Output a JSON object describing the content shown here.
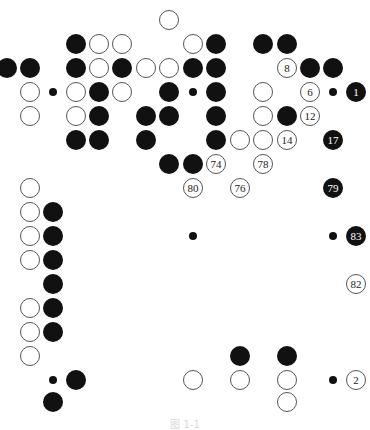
{
  "figure": {
    "type": "go-board-diagram",
    "caption": "图 1-1",
    "grid": {
      "columns_x": [
        7,
        30,
        53,
        76,
        99,
        122,
        146,
        169,
        193,
        216,
        240,
        263,
        287,
        310,
        333,
        356
      ],
      "rows_y": [
        20,
        44,
        68,
        92,
        116,
        140,
        164,
        188,
        212,
        236,
        260,
        284,
        308,
        332,
        356,
        380,
        402
      ]
    },
    "colors": {
      "black": "#111111",
      "white": "#ffffff",
      "outline": "#555555"
    },
    "stones": [
      {
        "c": 7,
        "r": 0,
        "color": "white",
        "label": ""
      },
      {
        "c": 3,
        "r": 1,
        "color": "black",
        "label": ""
      },
      {
        "c": 4,
        "r": 1,
        "color": "white",
        "label": ""
      },
      {
        "c": 5,
        "r": 1,
        "color": "white",
        "label": ""
      },
      {
        "c": 8,
        "r": 1,
        "color": "white",
        "label": ""
      },
      {
        "c": 9,
        "r": 1,
        "color": "black",
        "label": ""
      },
      {
        "c": 11,
        "r": 1,
        "color": "black",
        "label": ""
      },
      {
        "c": 12,
        "r": 1,
        "color": "black",
        "label": ""
      },
      {
        "c": 0,
        "r": 2,
        "color": "black",
        "label": ""
      },
      {
        "c": 1,
        "r": 2,
        "color": "black",
        "label": ""
      },
      {
        "c": 3,
        "r": 2,
        "color": "black",
        "label": ""
      },
      {
        "c": 4,
        "r": 2,
        "color": "white",
        "label": ""
      },
      {
        "c": 5,
        "r": 2,
        "color": "black",
        "label": ""
      },
      {
        "c": 6,
        "r": 2,
        "color": "white",
        "label": ""
      },
      {
        "c": 7,
        "r": 2,
        "color": "white",
        "label": ""
      },
      {
        "c": 8,
        "r": 2,
        "color": "black",
        "label": ""
      },
      {
        "c": 9,
        "r": 2,
        "color": "black",
        "label": ""
      },
      {
        "c": 12,
        "r": 2,
        "color": "white",
        "label": "8"
      },
      {
        "c": 13,
        "r": 2,
        "color": "black",
        "label": ""
      },
      {
        "c": 14,
        "r": 2,
        "color": "black",
        "label": ""
      },
      {
        "c": 1,
        "r": 3,
        "color": "white",
        "label": ""
      },
      {
        "c": 3,
        "r": 3,
        "color": "white",
        "label": ""
      },
      {
        "c": 4,
        "r": 3,
        "color": "black",
        "label": ""
      },
      {
        "c": 5,
        "r": 3,
        "color": "white",
        "label": ""
      },
      {
        "c": 7,
        "r": 3,
        "color": "black",
        "label": ""
      },
      {
        "c": 9,
        "r": 3,
        "color": "black",
        "label": ""
      },
      {
        "c": 11,
        "r": 3,
        "color": "white",
        "label": ""
      },
      {
        "c": 13,
        "r": 3,
        "color": "white",
        "label": "6"
      },
      {
        "c": 15,
        "r": 3,
        "color": "black",
        "label": "1"
      },
      {
        "c": 1,
        "r": 4,
        "color": "white",
        "label": ""
      },
      {
        "c": 3,
        "r": 4,
        "color": "white",
        "label": ""
      },
      {
        "c": 4,
        "r": 4,
        "color": "black",
        "label": ""
      },
      {
        "c": 6,
        "r": 4,
        "color": "black",
        "label": ""
      },
      {
        "c": 7,
        "r": 4,
        "color": "black",
        "label": ""
      },
      {
        "c": 9,
        "r": 4,
        "color": "black",
        "label": ""
      },
      {
        "c": 11,
        "r": 4,
        "color": "white",
        "label": ""
      },
      {
        "c": 12,
        "r": 4,
        "color": "black",
        "label": ""
      },
      {
        "c": 13,
        "r": 4,
        "color": "white",
        "label": "12"
      },
      {
        "c": 3,
        "r": 5,
        "color": "black",
        "label": ""
      },
      {
        "c": 4,
        "r": 5,
        "color": "black",
        "label": ""
      },
      {
        "c": 6,
        "r": 5,
        "color": "black",
        "label": ""
      },
      {
        "c": 9,
        "r": 5,
        "color": "black",
        "label": ""
      },
      {
        "c": 10,
        "r": 5,
        "color": "white",
        "label": ""
      },
      {
        "c": 11,
        "r": 5,
        "color": "white",
        "label": ""
      },
      {
        "c": 12,
        "r": 5,
        "color": "white",
        "label": "14"
      },
      {
        "c": 14,
        "r": 5,
        "color": "black",
        "label": "17"
      },
      {
        "c": 7,
        "r": 6,
        "color": "black",
        "label": ""
      },
      {
        "c": 8,
        "r": 6,
        "color": "black",
        "label": ""
      },
      {
        "c": 9,
        "r": 6,
        "color": "white",
        "label": "74"
      },
      {
        "c": 11,
        "r": 6,
        "color": "white",
        "label": "78"
      },
      {
        "c": 1,
        "r": 7,
        "color": "white",
        "label": ""
      },
      {
        "c": 8,
        "r": 7,
        "color": "white",
        "label": "80"
      },
      {
        "c": 10,
        "r": 7,
        "color": "white",
        "label": "76"
      },
      {
        "c": 14,
        "r": 7,
        "color": "black",
        "label": "79"
      },
      {
        "c": 1,
        "r": 8,
        "color": "white",
        "label": ""
      },
      {
        "c": 2,
        "r": 8,
        "color": "black",
        "label": ""
      },
      {
        "c": 1,
        "r": 9,
        "color": "white",
        "label": ""
      },
      {
        "c": 2,
        "r": 9,
        "color": "black",
        "label": ""
      },
      {
        "c": 15,
        "r": 9,
        "color": "black",
        "label": "83"
      },
      {
        "c": 1,
        "r": 10,
        "color": "white",
        "label": ""
      },
      {
        "c": 2,
        "r": 10,
        "color": "black",
        "label": ""
      },
      {
        "c": 2,
        "r": 11,
        "color": "black",
        "label": ""
      },
      {
        "c": 15,
        "r": 11,
        "color": "white",
        "label": "82"
      },
      {
        "c": 1,
        "r": 12,
        "color": "white",
        "label": ""
      },
      {
        "c": 2,
        "r": 12,
        "color": "black",
        "label": ""
      },
      {
        "c": 1,
        "r": 13,
        "color": "white",
        "label": ""
      },
      {
        "c": 2,
        "r": 13,
        "color": "black",
        "label": ""
      },
      {
        "c": 1,
        "r": 14,
        "color": "white",
        "label": ""
      },
      {
        "c": 10,
        "r": 14,
        "color": "black",
        "label": ""
      },
      {
        "c": 12,
        "r": 14,
        "color": "black",
        "label": ""
      },
      {
        "c": 3,
        "r": 15,
        "color": "black",
        "label": ""
      },
      {
        "c": 8,
        "r": 15,
        "color": "white",
        "label": ""
      },
      {
        "c": 10,
        "r": 15,
        "color": "white",
        "label": ""
      },
      {
        "c": 12,
        "r": 15,
        "color": "white",
        "label": ""
      },
      {
        "c": 15,
        "r": 15,
        "color": "white",
        "label": "2"
      },
      {
        "c": 2,
        "r": 16,
        "color": "black",
        "label": ""
      },
      {
        "c": 12,
        "r": 16,
        "color": "white",
        "label": ""
      }
    ],
    "star_points": [
      {
        "c": 2,
        "r": 3
      },
      {
        "c": 8,
        "r": 3
      },
      {
        "c": 14,
        "r": 3
      },
      {
        "c": 8,
        "r": 9
      },
      {
        "c": 14,
        "r": 9
      },
      {
        "c": 2,
        "r": 15
      },
      {
        "c": 14,
        "r": 15
      }
    ]
  }
}
